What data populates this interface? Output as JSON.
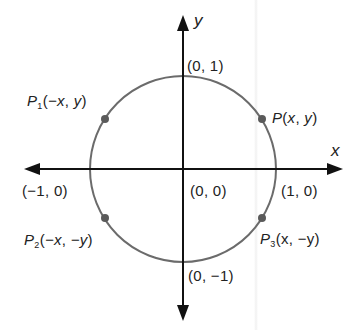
{
  "diagram": {
    "axes": {
      "x_label": "x",
      "y_label": "y"
    },
    "intercepts": {
      "top": "(0, 1)",
      "bottom": "(0, −1)",
      "left": "(−1, 0)",
      "right": "(1, 0)",
      "origin": "(0, 0)"
    },
    "points": [
      {
        "id": "P",
        "letter": "P",
        "sub": "",
        "coords_open": "(",
        "cx": "x",
        "sep": ", ",
        "cy": "y",
        "coords_close": ")"
      },
      {
        "id": "P1",
        "letter": "P",
        "sub": "1",
        "coords_open": "(",
        "cx": "−x",
        "sep": ", ",
        "cy": "y",
        "coords_close": ")"
      },
      {
        "id": "P2",
        "letter": "P",
        "sub": "2",
        "coords_open": "(",
        "cx": "−x",
        "sep": ", ",
        "cy": "−y",
        "coords_close": ")"
      },
      {
        "id": "P3",
        "letter": "P",
        "sub": "3",
        "coords_open": "(",
        "cx": "x",
        "sep": ", ",
        "cy": "−y",
        "coords_close": ")"
      }
    ],
    "colors": {
      "axis": "#111111",
      "circle": "#6b6b6b",
      "point": "#5a5a5a",
      "text": "#222222"
    }
  }
}
